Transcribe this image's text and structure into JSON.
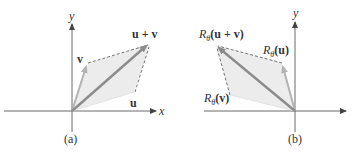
{
  "figure": {
    "panels": [
      {
        "id": "a",
        "caption": "(a)",
        "axes": {
          "x_label": "x",
          "y_label": "y"
        },
        "vectors": [
          {
            "name": "v",
            "label": "v"
          },
          {
            "name": "u",
            "label": "u"
          },
          {
            "name": "u+v",
            "label": "u + v"
          }
        ]
      },
      {
        "id": "b",
        "caption": "(b)",
        "axes": {
          "y_label": "y"
        },
        "vectors": [
          {
            "name": "R(u+v)",
            "label_prefix": "R",
            "label_sub": "θ",
            "label_arg": "(u + v)"
          },
          {
            "name": "R(u)",
            "label_prefix": "R",
            "label_sub": "θ",
            "label_arg": "(u)"
          },
          {
            "name": "R(v)",
            "label_prefix": "R",
            "label_sub": "θ",
            "label_arg": "(v)"
          }
        ]
      }
    ],
    "colors": {
      "axis": "#444444",
      "sum_vector": "#8c8c8c",
      "component_vector": "#b3b3b3",
      "parallelogram_fill": "#ececec",
      "dashed": "#555555"
    }
  }
}
